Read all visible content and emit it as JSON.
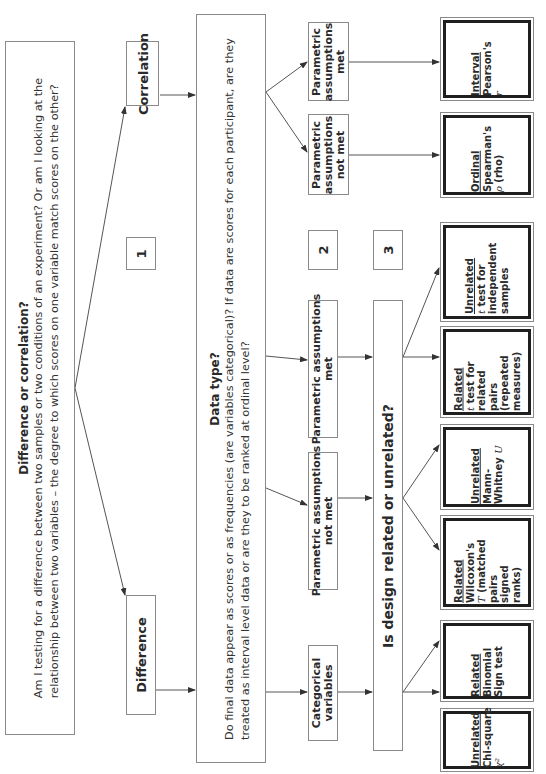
{
  "diagram": {
    "orientation": "rotated 90 degrees counterclockwise",
    "root": {
      "title": "Difference or correlation?",
      "body_line1": "Am I testing for a difference between two samples or two conditions of an experiment? Or am I looking at the",
      "body_line2": "relationship between two variables – the degree to which scores on one variable match scores on the other?"
    },
    "branches": {
      "difference": "Difference",
      "correlation": "Correlation",
      "step1": "1"
    },
    "data_type": {
      "title": "Data type?",
      "body_line1": "Do final data appear as scores or as frequencies (are variables categorical)? If data are scores for each participant, are they",
      "body_line2": "treated as interval level data or are they to be ranked at ordinal level?"
    },
    "step2": "2",
    "step3": "3",
    "difference_branch": {
      "categorical": [
        "Categorical",
        "variables"
      ],
      "param_not_met": [
        "Parametric assumptions",
        "not met"
      ],
      "param_met": [
        "Parametric assumptions",
        "met"
      ]
    },
    "correlation_branch": {
      "param_not_met": [
        "Parametric",
        "assumptions",
        "not met"
      ],
      "param_met": [
        "Parametric",
        "assumptions",
        "met"
      ]
    },
    "design_question": "Is design related or unrelated?",
    "results": [
      {
        "id": "chi-square",
        "design": "Unrelated",
        "lines": [
          "Chi-square"
        ],
        "symbol": "χ²"
      },
      {
        "id": "binomial",
        "design": "Related",
        "lines": [
          "Binomial",
          "Sign test"
        ],
        "symbol": ""
      },
      {
        "id": "wilcoxon",
        "design": "Related",
        "lines": [
          "Wilcoxon's"
        ],
        "symbol": "T",
        "after_symbol": " (matched",
        "tail": [
          "pairs",
          "signed",
          "ranks)"
        ]
      },
      {
        "id": "mann-whitney",
        "design": "Unrelated",
        "lines": [
          "Mann-"
        ],
        "last_line": "Whitney",
        "symbol": "U"
      },
      {
        "id": "related-t",
        "design": "Related",
        "symbol": "t",
        "after_symbol": " test for",
        "tail": [
          "related",
          "pairs",
          "(repeated",
          "measures)"
        ]
      },
      {
        "id": "unrelated-t",
        "design": "Unrelated",
        "symbol": "t",
        "after_symbol": " test for",
        "tail": [
          "independent",
          "samples"
        ]
      },
      {
        "id": "spearman",
        "design": "Ordinal",
        "lines": [
          "Spearman's"
        ],
        "symbol": "ρ",
        "after_symbol": " (rho)"
      },
      {
        "id": "pearson",
        "design": "Interval",
        "lines": [
          "Pearson's"
        ],
        "symbol": "r"
      }
    ],
    "colors": {
      "box_border": "#8a8a8a",
      "result_border": "#1f1f1f",
      "line": "#555555",
      "text": "#2a2a2a"
    }
  }
}
